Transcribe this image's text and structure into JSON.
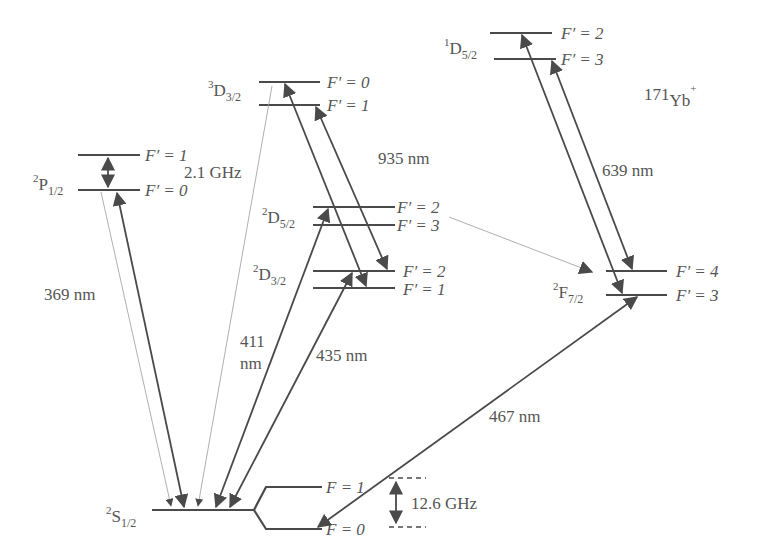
{
  "diagram": {
    "ion": {
      "mass": "171",
      "symbol": "Yb",
      "charge": "+"
    },
    "colors": {
      "line": "#4a4a4a",
      "text": "#555555",
      "decay": "#9a9a9a"
    },
    "levels": {
      "S12": {
        "sup": "2",
        "letter": "S",
        "sub": "1/2",
        "upper": "F = 1",
        "lower": "F = 0",
        "splitting": "12.6 GHz"
      },
      "P12": {
        "sup": "2",
        "letter": "P",
        "sub": "1/2",
        "upper": "F′ = 1",
        "lower": "F′ = 0",
        "splitting": "2.1 GHz"
      },
      "D32_3": {
        "sup": "3",
        "letter": "D",
        "sub": "3/2",
        "upper": "F′ = 0",
        "lower": "F′ = 1"
      },
      "D52_2": {
        "sup": "2",
        "letter": "D",
        "sub": "5/2",
        "upper": "F′ = 2",
        "lower": "F′ = 3"
      },
      "D32_2": {
        "sup": "2",
        "letter": "D",
        "sub": "3/2",
        "upper": "F′ = 2",
        "lower": "F′ = 1"
      },
      "D52_1": {
        "sup": "1",
        "letter": "D",
        "sub": "5/2",
        "upper": "F′ = 2",
        "lower": "F′ = 3"
      },
      "F72": {
        "sup": "2",
        "letter": "F",
        "sub": "7/2",
        "upper": "F′ = 4",
        "lower": "F′ = 3"
      }
    },
    "transitions": [
      {
        "from": "2S1/2",
        "to": "2P1/2",
        "wavelength": "369 nm"
      },
      {
        "from": "2S1/2",
        "to": "2D5/2",
        "wavelength_line1": "411",
        "wavelength_line2": "nm"
      },
      {
        "from": "2S1/2",
        "to": "2D3/2",
        "wavelength": "435 nm"
      },
      {
        "from": "2D3/2",
        "to": "3D3/2",
        "wavelength": "935 nm"
      },
      {
        "from": "2F7/2",
        "to": "1D5/2",
        "wavelength": "639 nm"
      },
      {
        "from": "2S1/2",
        "to": "2F7/2",
        "wavelength": "467 nm"
      }
    ]
  }
}
